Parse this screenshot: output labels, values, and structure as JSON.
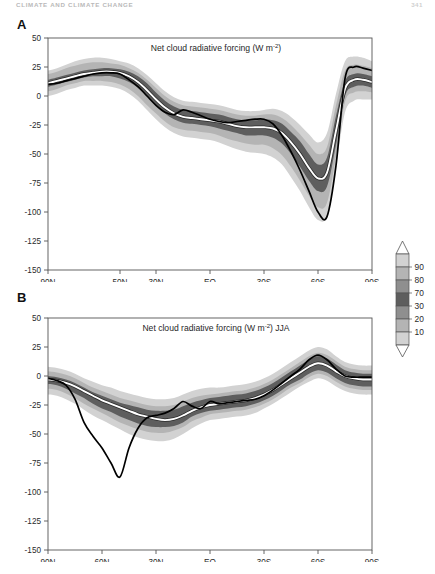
{
  "page": {
    "running_head": "CLIMATE AND CLIMATE CHANGE",
    "folio": "341"
  },
  "legend": {
    "name": "percentile-colorbar",
    "labels": [
      "90",
      "80",
      "70",
      "30",
      "20",
      "10"
    ],
    "band_colors": [
      "#ffffff",
      "#d2d2d2",
      "#b4b4b4",
      "#8f8f8f",
      "#5e5e5e",
      "#8f8f8f",
      "#b4b4b4",
      "#d2d2d2",
      "#ffffff"
    ],
    "outline_color": "#555555"
  },
  "panels": [
    {
      "letter": "A",
      "name": "panel-a",
      "title_main": "Net cloud radiative forcing (W m",
      "title_sup": "-2",
      "title_tail": ")",
      "season": ""
    },
    {
      "letter": "B",
      "name": "panel-b",
      "title_main": "Net cloud radiative forcing (W m",
      "title_sup": "-2",
      "title_tail": ") JJA",
      "season": "JJA"
    }
  ],
  "chart_data": [
    {
      "type": "area",
      "name": "panel-a-chart",
      "title": "Net cloud radiative forcing (W m-2)",
      "xlabel": "",
      "ylabel": "",
      "ylim": [
        -150,
        50
      ],
      "yticks": [
        50,
        25,
        0,
        -25,
        -50,
        -75,
        -100,
        -125,
        -150
      ],
      "yticklabels": [
        "50",
        "25",
        "0",
        "-25",
        "-50",
        "-75",
        "-100",
        "-125",
        "-150"
      ],
      "xlim": [
        90,
        -90
      ],
      "xticks": [
        90,
        50,
        30,
        0,
        -30,
        -60,
        -90
      ],
      "xticklabels": [
        "90N",
        "50N",
        "30N",
        "EQ",
        "30S",
        "60S",
        "90S"
      ],
      "grid": false,
      "legend_position": "right-outside",
      "x": [
        90,
        85,
        80,
        75,
        70,
        65,
        60,
        55,
        50,
        45,
        40,
        35,
        30,
        25,
        20,
        15,
        10,
        5,
        0,
        -5,
        -10,
        -15,
        -20,
        -25,
        -30,
        -35,
        -40,
        -45,
        -50,
        -55,
        -60,
        -65,
        -70,
        -75,
        -80,
        -85,
        -90
      ],
      "series": [
        {
          "name": "p50-median-model",
          "color": "#ffffff",
          "style": "white-line",
          "values": [
            11,
            13,
            15,
            17,
            19,
            20,
            21,
            21,
            20,
            17,
            12,
            5,
            -3,
            -10,
            -15,
            -18,
            -19,
            -20,
            -21,
            -22,
            -24,
            -26,
            -27,
            -27,
            -27,
            -28,
            -32,
            -40,
            -50,
            -62,
            -71,
            -66,
            -30,
            6,
            14,
            14,
            12
          ]
        },
        {
          "name": "observations",
          "color": "#000000",
          "style": "black-line",
          "values": [
            10,
            11,
            13,
            15,
            17,
            19,
            20,
            20,
            19,
            14,
            8,
            0,
            -8,
            -14,
            -16,
            -12,
            -14,
            -17,
            -20,
            -22,
            -23,
            -22,
            -21,
            -20,
            -20,
            -24,
            -34,
            -48,
            -64,
            -82,
            -100,
            -104,
            -60,
            15,
            25,
            24,
            22
          ]
        },
        {
          "name": "p10-p90-envelope-lower",
          "color": "#d2d2d2",
          "style": "band-outer-lower",
          "values": [
            0,
            2,
            5,
            7,
            9,
            9,
            9,
            8,
            6,
            2,
            -4,
            -12,
            -20,
            -27,
            -32,
            -35,
            -36,
            -37,
            -38,
            -40,
            -43,
            -46,
            -48,
            -49,
            -50,
            -53,
            -59,
            -70,
            -82,
            -96,
            -107,
            -103,
            -60,
            -14,
            -4,
            -3,
            -3
          ]
        },
        {
          "name": "p10-p90-envelope-upper",
          "color": "#d2d2d2",
          "style": "band-outer-upper",
          "values": [
            22,
            24,
            27,
            30,
            32,
            33,
            33,
            32,
            30,
            28,
            24,
            18,
            11,
            4,
            -1,
            -4,
            -5,
            -6,
            -7,
            -8,
            -10,
            -12,
            -13,
            -13,
            -12,
            -11,
            -13,
            -18,
            -25,
            -33,
            -40,
            -32,
            2,
            30,
            34,
            33,
            30
          ]
        },
        {
          "name": "p20-p80-envelope-lower",
          "color": "#b4b4b4",
          "style": "band-mid-lower",
          "values": [
            4,
            6,
            9,
            11,
            13,
            13,
            13,
            12,
            10,
            6,
            0,
            -8,
            -15,
            -22,
            -27,
            -29,
            -30,
            -31,
            -32,
            -34,
            -37,
            -39,
            -41,
            -42,
            -42,
            -45,
            -51,
            -61,
            -73,
            -86,
            -96,
            -92,
            -52,
            -5,
            3,
            4,
            3
          ]
        },
        {
          "name": "p20-p80-envelope-upper",
          "color": "#b4b4b4",
          "style": "band-mid-upper",
          "values": [
            19,
            21,
            24,
            26,
            28,
            29,
            29,
            28,
            27,
            24,
            20,
            14,
            7,
            0,
            -5,
            -8,
            -9,
            -10,
            -11,
            -12,
            -14,
            -16,
            -17,
            -17,
            -16,
            -16,
            -19,
            -25,
            -33,
            -42,
            -50,
            -44,
            -8,
            22,
            27,
            26,
            24
          ]
        },
        {
          "name": "p30-p70-envelope-lower",
          "color": "#5e5e5e",
          "style": "band-inner-lower",
          "values": [
            8,
            10,
            12,
            14,
            16,
            17,
            17,
            17,
            15,
            12,
            7,
            0,
            -8,
            -15,
            -20,
            -23,
            -24,
            -25,
            -26,
            -28,
            -30,
            -32,
            -34,
            -34,
            -34,
            -36,
            -41,
            -50,
            -61,
            -73,
            -82,
            -78,
            -42,
            0,
            8,
            9,
            7
          ]
        },
        {
          "name": "p30-p70-envelope-upper",
          "color": "#5e5e5e",
          "style": "band-inner-upper",
          "values": [
            14,
            16,
            18,
            20,
            22,
            23,
            24,
            24,
            23,
            21,
            17,
            11,
            3,
            -4,
            -9,
            -12,
            -13,
            -14,
            -15,
            -16,
            -18,
            -20,
            -21,
            -21,
            -20,
            -21,
            -24,
            -31,
            -39,
            -50,
            -59,
            -53,
            -17,
            13,
            19,
            19,
            17
          ]
        }
      ]
    },
    {
      "type": "area",
      "name": "panel-b-chart",
      "title": "Net cloud radiative forcing (W m-2) JJA",
      "xlabel": "",
      "ylabel": "",
      "ylim": [
        -150,
        50
      ],
      "yticks": [
        50,
        25,
        0,
        -25,
        -50,
        -75,
        -100,
        -125,
        -150
      ],
      "yticklabels": [
        "50",
        "25",
        "0",
        "-25",
        "-50",
        "-75",
        "-100",
        "-125",
        "-150"
      ],
      "xlim": [
        90,
        -90
      ],
      "xticks": [
        90,
        60,
        30,
        0,
        -30,
        -60,
        -90
      ],
      "xticklabels": [
        "90N",
        "60N",
        "30N",
        "EQ",
        "30S",
        "60S",
        "90S"
      ],
      "grid": false,
      "legend_position": "right-outside",
      "x": [
        90,
        85,
        80,
        75,
        70,
        65,
        60,
        55,
        50,
        45,
        40,
        35,
        30,
        25,
        20,
        15,
        10,
        5,
        0,
        -5,
        -10,
        -15,
        -20,
        -25,
        -30,
        -35,
        -40,
        -45,
        -50,
        -55,
        -60,
        -65,
        -70,
        -75,
        -80,
        -85,
        -90
      ],
      "series": [
        {
          "name": "p50-median-model",
          "color": "#ffffff",
          "style": "white-line",
          "values": [
            -3,
            -4,
            -6,
            -9,
            -13,
            -17,
            -21,
            -24,
            -27,
            -30,
            -33,
            -35,
            -37,
            -38,
            -37,
            -34,
            -30,
            -27,
            -25,
            -24,
            -23,
            -22,
            -21,
            -19,
            -16,
            -12,
            -7,
            -2,
            3,
            8,
            11,
            9,
            4,
            0,
            -2,
            -3,
            -3
          ]
        },
        {
          "name": "observations",
          "color": "#000000",
          "style": "black-line",
          "values": [
            -2,
            -4,
            -8,
            -20,
            -40,
            -52,
            -62,
            -75,
            -87,
            -62,
            -45,
            -36,
            -34,
            -32,
            -28,
            -22,
            -26,
            -28,
            -22,
            -24,
            -23,
            -22,
            -21,
            -20,
            -17,
            -12,
            -6,
            0,
            6,
            14,
            18,
            14,
            6,
            0,
            -1,
            -1,
            -1
          ]
        },
        {
          "name": "p10-p90-envelope-lower",
          "color": "#d2d2d2",
          "style": "band-outer-lower",
          "values": [
            -16,
            -17,
            -20,
            -24,
            -29,
            -34,
            -38,
            -42,
            -46,
            -50,
            -53,
            -55,
            -56,
            -56,
            -54,
            -50,
            -45,
            -41,
            -38,
            -37,
            -36,
            -35,
            -34,
            -32,
            -28,
            -24,
            -19,
            -14,
            -9,
            -5,
            -2,
            -4,
            -9,
            -13,
            -15,
            -16,
            -16
          ]
        },
        {
          "name": "p10-p90-envelope-upper",
          "color": "#d2d2d2",
          "style": "band-outer-upper",
          "values": [
            8,
            7,
            5,
            2,
            -2,
            -5,
            -8,
            -10,
            -13,
            -15,
            -17,
            -19,
            -20,
            -20,
            -19,
            -16,
            -13,
            -11,
            -10,
            -10,
            -9,
            -8,
            -7,
            -5,
            -2,
            2,
            7,
            12,
            17,
            22,
            25,
            23,
            17,
            12,
            10,
            9,
            9
          ]
        },
        {
          "name": "p20-p80-envelope-lower",
          "color": "#b4b4b4",
          "style": "band-mid-lower",
          "values": [
            -11,
            -12,
            -15,
            -19,
            -24,
            -28,
            -32,
            -36,
            -40,
            -43,
            -46,
            -48,
            -49,
            -49,
            -47,
            -44,
            -39,
            -36,
            -33,
            -32,
            -31,
            -30,
            -29,
            -27,
            -24,
            -20,
            -15,
            -10,
            -6,
            -1,
            2,
            0,
            -5,
            -9,
            -11,
            -12,
            -12
          ]
        },
        {
          "name": "p20-p80-envelope-upper",
          "color": "#b4b4b4",
          "style": "band-mid-upper",
          "values": [
            4,
            3,
            1,
            -2,
            -6,
            -10,
            -13,
            -16,
            -19,
            -21,
            -23,
            -25,
            -26,
            -26,
            -25,
            -22,
            -19,
            -17,
            -16,
            -15,
            -14,
            -13,
            -12,
            -10,
            -7,
            -3,
            2,
            7,
            12,
            17,
            20,
            18,
            13,
            8,
            6,
            5,
            5
          ]
        },
        {
          "name": "p30-p70-envelope-lower",
          "color": "#5e5e5e",
          "style": "band-inner-lower",
          "values": [
            -7,
            -8,
            -11,
            -15,
            -19,
            -24,
            -28,
            -31,
            -35,
            -38,
            -41,
            -43,
            -44,
            -44,
            -43,
            -40,
            -35,
            -32,
            -30,
            -29,
            -28,
            -27,
            -26,
            -24,
            -21,
            -17,
            -12,
            -7,
            -3,
            2,
            5,
            3,
            -2,
            -6,
            -8,
            -9,
            -9
          ]
        },
        {
          "name": "p30-p70-envelope-upper",
          "color": "#5e5e5e",
          "style": "band-inner-upper",
          "values": [
            0,
            -1,
            -3,
            -6,
            -10,
            -14,
            -17,
            -20,
            -23,
            -25,
            -27,
            -29,
            -30,
            -30,
            -29,
            -26,
            -23,
            -21,
            -19,
            -18,
            -17,
            -16,
            -15,
            -13,
            -10,
            -6,
            -1,
            4,
            9,
            14,
            17,
            15,
            10,
            5,
            3,
            2,
            2
          ]
        }
      ]
    }
  ]
}
